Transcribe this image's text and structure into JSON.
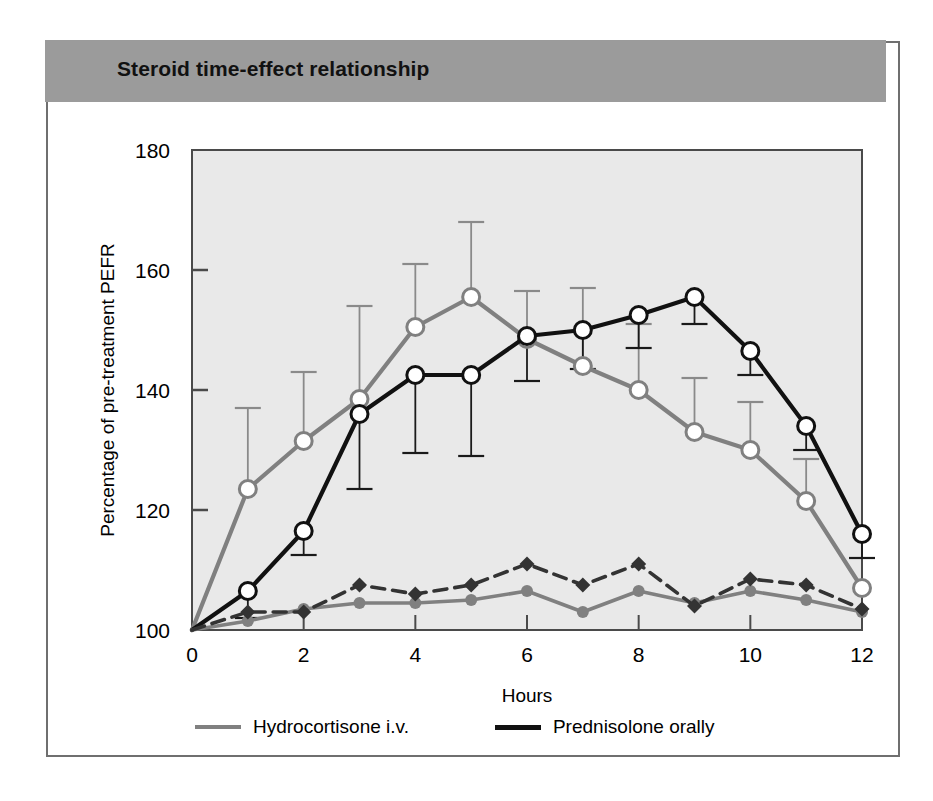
{
  "figure": {
    "title": "Steroid time-effect relationship",
    "header_color": "#9b9b9b",
    "plot_background": "#e9e9e9",
    "frame_color": "#6f6f6f"
  },
  "legend": {
    "position": "below-axes",
    "entries": [
      {
        "label": "Hydrocortisone i.v.",
        "color": "#808080",
        "swatch": "gray"
      },
      {
        "label": "Prednisolone orally",
        "color": "#111111",
        "swatch": "black"
      }
    ]
  },
  "chart_data": {
    "type": "line",
    "title": "Steroid time-effect relationship",
    "xlabel": "Hours",
    "ylabel": "Percentage of pre-treatment PEFR",
    "xlim": [
      0,
      12
    ],
    "ylim": [
      100,
      180
    ],
    "xticks": [
      0,
      1,
      2,
      3,
      4,
      5,
      6,
      7,
      8,
      9,
      10,
      11,
      12
    ],
    "xtick_labels": [
      "0",
      "",
      "2",
      "",
      "4",
      "",
      "6",
      "",
      "8",
      "",
      "10",
      "",
      "12"
    ],
    "yticks": [
      100,
      120,
      140,
      160,
      180
    ],
    "ytick_labels": [
      "100",
      "120",
      "140",
      "160",
      "180"
    ],
    "grid": false,
    "x": [
      0,
      1,
      2,
      3,
      4,
      5,
      6,
      7,
      8,
      9,
      10,
      11,
      12
    ],
    "series": [
      {
        "name": "Hydrocortisone i.v.",
        "color": "#808080",
        "style": "solid",
        "marker": "open-circle",
        "errorbar": "upper",
        "values": [
          100,
          123.5,
          131.5,
          138.5,
          150.5,
          155.5,
          148.5,
          144,
          140,
          133,
          130,
          121.5,
          107
        ],
        "errors": [
          0,
          13.5,
          11.5,
          15.5,
          10.5,
          12.5,
          8,
          13,
          11,
          9,
          8,
          7,
          0
        ]
      },
      {
        "name": "Prednisolone orally",
        "color": "#111111",
        "style": "solid",
        "marker": "open-circle",
        "errorbar": "lower",
        "values": [
          100,
          106.5,
          116.5,
          136,
          142.5,
          142.5,
          149,
          150,
          152.5,
          155.5,
          146.5,
          134,
          116
        ],
        "errors": [
          0,
          4.5,
          4,
          12.5,
          13,
          13.5,
          7.5,
          6.5,
          5.5,
          4.5,
          4,
          4,
          4
        ]
      },
      {
        "name": "Hydrocortisone i.v. control",
        "color": "#808080",
        "style": "solid",
        "marker": "filled-circle",
        "errorbar": "none",
        "values": [
          100,
          101.5,
          103.5,
          104.5,
          104.5,
          105,
          106.5,
          103,
          106.5,
          104.5,
          106.5,
          105,
          103
        ],
        "errors": [
          0,
          0,
          0,
          0,
          0,
          0,
          0,
          0,
          0,
          0,
          0,
          0,
          0
        ]
      },
      {
        "name": "Prednisolone orally control",
        "color": "#333333",
        "style": "dashed",
        "marker": "filled-diamond",
        "errorbar": "none",
        "values": [
          100,
          103,
          103,
          107.5,
          106,
          107.5,
          111,
          107.5,
          111,
          104,
          108.5,
          107.5,
          103.5
        ],
        "errors": [
          0,
          0,
          0,
          0,
          0,
          0,
          0,
          0,
          0,
          0,
          0,
          0,
          0
        ]
      }
    ]
  }
}
